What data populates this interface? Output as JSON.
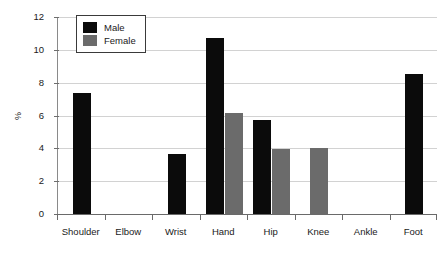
{
  "chart_data": {
    "type": "bar",
    "title": "",
    "subtitle": "",
    "xlabel": "",
    "ylabel": "%",
    "categories": [
      "Shoulder",
      "Elbow",
      "Wrist",
      "Hand",
      "Hip",
      "Knee",
      "Ankle",
      "Foot"
    ],
    "series": [
      {
        "name": "Male",
        "color": "#0b0b0b",
        "values": [
          7.4,
          0,
          3.65,
          10.7,
          5.75,
          0,
          0,
          8.55
        ]
      },
      {
        "name": "Female",
        "color": "#6b6b6b",
        "values": [
          0,
          0,
          0,
          6.15,
          3.95,
          4.05,
          0,
          0
        ]
      }
    ],
    "ylim": [
      0,
      12
    ],
    "yticks": [
      0,
      2,
      4,
      6,
      8,
      10,
      12
    ],
    "ytick_labels": [
      "0",
      "2",
      "4",
      "6",
      "8",
      "10",
      "12"
    ],
    "grid": true,
    "grid_axis": "y",
    "legend_position": "top-left",
    "legend_entries": [
      "Male",
      "Female"
    ]
  },
  "colors": {
    "male": "#0b0b0b",
    "female": "#6b6b6b",
    "gridline": "#d2d2d2",
    "axis": "#6a6a6a",
    "background": "#ffffff"
  }
}
